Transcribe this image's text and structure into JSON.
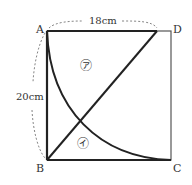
{
  "diagram": {
    "vertices": {
      "A": "A",
      "B": "B",
      "C": "C",
      "D": "D"
    },
    "top_dimension": "18cm",
    "left_dimension": "20cm",
    "region_upper": "㋐",
    "region_lower": "㋑",
    "colors": {
      "stroke": "#222222",
      "dashed": "#666666",
      "label": "#333333"
    }
  }
}
